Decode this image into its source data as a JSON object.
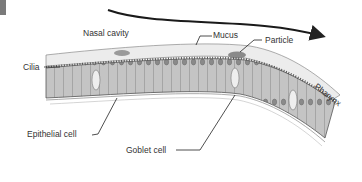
{
  "diagram": {
    "title": "",
    "type": "anatomical illustration",
    "colors": {
      "line": "#333333",
      "cell_fill": "#bdbdbd",
      "cell_stroke": "#5a5a5a",
      "mucus_fill": "#ececec",
      "nucleus": "#6a6a6a",
      "corner_block": "#7a7a7a"
    },
    "arrow": {
      "label": "",
      "direction": "toward pharynx"
    },
    "labels": {
      "nasal_cavity": "Nasal cavity",
      "mucus": "Mucus",
      "particle": "Particle",
      "cilia": "Cilia",
      "pharynx": "Pharynx",
      "epithelial_cell": "Epithelial cell",
      "goblet_cell": "Goblet cell"
    }
  }
}
